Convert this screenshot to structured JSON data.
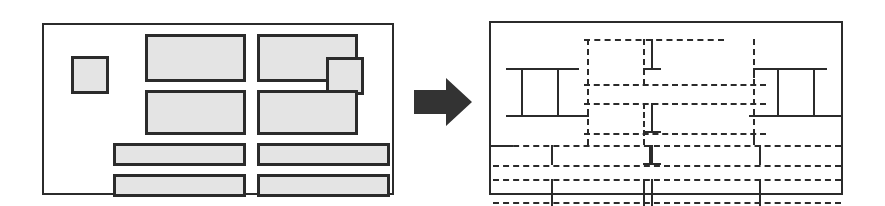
{
  "figure": {
    "background_color": "#ffffff",
    "stroke_color": "#2b2b2b",
    "block_fill_color": "#e4e4e4",
    "arrow_color": "#333333",
    "width": 885,
    "height": 206
  },
  "left_panel": {
    "label": "Original page layout with solid content blocks",
    "frame": {
      "x": 42,
      "y": 23,
      "w": 352,
      "h": 172
    },
    "blocks": [
      {
        "name": "small-square-left",
        "x": 27,
        "y": 31,
        "w": 38,
        "h": 38
      },
      {
        "name": "block-top-left",
        "x": 101,
        "y": 9,
        "w": 101,
        "h": 48
      },
      {
        "name": "block-top-right",
        "x": 213,
        "y": 9,
        "w": 101,
        "h": 48
      },
      {
        "name": "small-square-right",
        "x": 282,
        "y": 32,
        "w": 38,
        "h": 38
      },
      {
        "name": "block-mid-left",
        "x": 101,
        "y": 65,
        "w": 101,
        "h": 45
      },
      {
        "name": "block-mid-right",
        "x": 213,
        "y": 65,
        "w": 101,
        "h": 45
      },
      {
        "name": "bar-row3-left",
        "x": 69,
        "y": 118,
        "w": 133,
        "h": 23
      },
      {
        "name": "bar-row3-right",
        "x": 213,
        "y": 118,
        "w": 133,
        "h": 23
      },
      {
        "name": "bar-row4-left",
        "x": 69,
        "y": 149,
        "w": 133,
        "h": 23
      },
      {
        "name": "bar-row4-right",
        "x": 213,
        "y": 149,
        "w": 133,
        "h": 23
      }
    ]
  },
  "arrow": {
    "label": "transformation arrow pointing right",
    "direction": "right",
    "x": 412,
    "y": 76,
    "w": 62,
    "h": 52
  },
  "right_panel": {
    "label": "Resulting segmentation grid drawn with dashed separators",
    "frame": {
      "x": 489,
      "y": 21,
      "w": 354,
      "h": 174
    },
    "dashed_horizontals": [
      {
        "name": "seg-h-top-mid",
        "x": 93,
        "y": 16,
        "w": 140
      },
      {
        "name": "seg-h-left-upper",
        "x": 15,
        "y": 45,
        "w": 72
      },
      {
        "name": "seg-h-left-upper-b",
        "x": 44,
        "y": 45,
        "w": 52
      },
      {
        "name": "seg-h-right-upper",
        "x": 264,
        "y": 45,
        "w": 72
      },
      {
        "name": "seg-h-center-a",
        "x": 93,
        "y": 61,
        "w": 182
      },
      {
        "name": "seg-h-center-b",
        "x": 93,
        "y": 80,
        "w": 182
      },
      {
        "name": "seg-h-left-lower",
        "x": 15,
        "y": 92,
        "w": 83
      },
      {
        "name": "seg-h-right-lower",
        "x": 258,
        "y": 92,
        "w": 80
      },
      {
        "name": "seg-h-center-c",
        "x": 93,
        "y": 110,
        "w": 182
      },
      {
        "name": "seg-h-full-1",
        "x": 2,
        "y": 122,
        "w": 348
      },
      {
        "name": "seg-h-full-2",
        "x": 2,
        "y": 142,
        "w": 348
      },
      {
        "name": "seg-h-full-3",
        "x": 2,
        "y": 156,
        "w": 348
      },
      {
        "name": "seg-h-full-4",
        "x": 2,
        "y": 179,
        "w": 348
      }
    ],
    "dashed_verticals": [
      {
        "name": "seg-v-left-col",
        "x": 96,
        "y": 16,
        "h": 106
      },
      {
        "name": "seg-v-center-a",
        "x": 152,
        "y": 16,
        "h": 46
      },
      {
        "name": "seg-v-center-b",
        "x": 152,
        "y": 80,
        "h": 42
      },
      {
        "name": "seg-v-right-col",
        "x": 262,
        "y": 16,
        "h": 106
      },
      {
        "name": "seg-v-pair-left",
        "x": 30,
        "y": 45,
        "h": 47
      },
      {
        "name": "seg-v-pair-right",
        "x": 66,
        "y": 45,
        "h": 47
      },
      {
        "name": "seg-v-rpair-left",
        "x": 286,
        "y": 45,
        "h": 47
      },
      {
        "name": "seg-v-rpair-right",
        "x": 322,
        "y": 45,
        "h": 47
      },
      {
        "name": "seg-v-bot-left",
        "x": 60,
        "y": 122,
        "h": 20
      },
      {
        "name": "seg-v-bot-center",
        "x": 158,
        "y": 122,
        "h": 20
      },
      {
        "name": "seg-v-bot-right",
        "x": 268,
        "y": 122,
        "h": 20
      },
      {
        "name": "seg-v-bot2-left",
        "x": 60,
        "y": 156,
        "h": 36
      },
      {
        "name": "seg-v-bot2-cA",
        "x": 152,
        "y": 156,
        "h": 36
      },
      {
        "name": "seg-v-bot2-cB",
        "x": 160,
        "y": 156,
        "h": 36
      },
      {
        "name": "seg-v-bot2-right",
        "x": 268,
        "y": 156,
        "h": 36
      }
    ]
  }
}
